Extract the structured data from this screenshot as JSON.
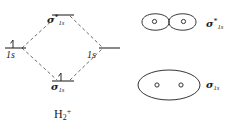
{
  "figure": {
    "molecule_label": "H",
    "molecule_sub": "2",
    "molecule_sup": "+",
    "line_color": "#2b2b2b",
    "dashed_color": "#555555",
    "background": "#ffffff"
  },
  "mo_diagram": {
    "levels": [
      {
        "id": "antibonding",
        "name": "sigma-star-1s",
        "sigma": "σ",
        "star": "*",
        "subscript": "1s",
        "electrons": 0,
        "line_style": "solid"
      },
      {
        "id": "atomic-left",
        "name": "hydrogen-1s-left",
        "orbital": "1s",
        "electrons": 1,
        "line_style": "solid"
      },
      {
        "id": "atomic-right",
        "name": "hydrogen-1s-right",
        "orbital": "1s",
        "electrons": 0,
        "line_style": "solid"
      },
      {
        "id": "bonding",
        "name": "sigma-1s",
        "sigma": "σ",
        "subscript": "1s",
        "electrons": 1,
        "line_style": "solid"
      }
    ],
    "correlation_lines": "dashed",
    "electron_arrow": "↑"
  },
  "orbital_shapes": [
    {
      "id": "antibonding-shape",
      "label_sigma": "σ",
      "label_star": "*",
      "label_sub": "1s",
      "description": "two separate lobes",
      "nuclei": 2
    },
    {
      "id": "bonding-shape",
      "label_sigma": "σ",
      "label_sub": "1s",
      "description": "single merged ellipse",
      "nuclei": 2
    }
  ]
}
